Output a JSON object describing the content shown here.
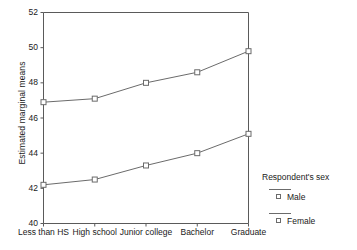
{
  "chart_data": {
    "type": "line",
    "title": "",
    "xlabel": "",
    "ylabel": "Estimated marginal means",
    "categories": [
      "Less than HS",
      "High school",
      "Junior college",
      "Bachelor",
      "Graduate"
    ],
    "series": [
      {
        "name": "Male",
        "values": [
          46.9,
          47.1,
          48.0,
          48.6,
          49.8
        ]
      },
      {
        "name": "Female",
        "values": [
          42.2,
          42.5,
          43.3,
          44.0,
          45.1
        ]
      }
    ],
    "ylim": [
      40,
      52
    ],
    "yticks": [
      40,
      42,
      44,
      46,
      48,
      50,
      52
    ],
    "ytick_labels": [
      "40",
      "42",
      "44",
      "46",
      "48",
      "50",
      "52"
    ],
    "grid": false,
    "legend": {
      "position": "right",
      "title": "Respondent's sex",
      "entries": [
        "Male",
        "Female"
      ]
    },
    "marker": "open-square",
    "line_color": "#6b6b6b",
    "axis_color": "#5a5a5a",
    "background": "#ffffff"
  }
}
